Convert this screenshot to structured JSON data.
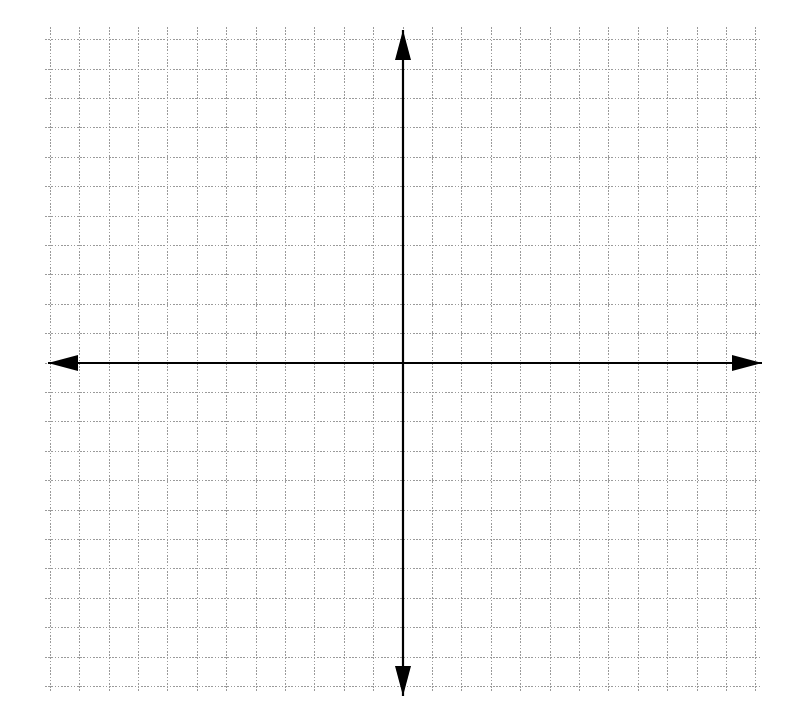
{
  "figure": {
    "title": "",
    "width": 795,
    "height": 719,
    "background_color": "#ffffff"
  },
  "chart_data": {
    "type": "scatter",
    "title": "",
    "subtitle": "",
    "xlabel": "",
    "ylabel": "",
    "series": [],
    "x": [],
    "values": [],
    "annotations": [],
    "legend": {
      "entries": [],
      "position": "none",
      "visible": false
    },
    "grid": {
      "visible": true,
      "style": "dotted",
      "color": "#9a9a9a",
      "line_width": 1,
      "cell_size_px": 29.4,
      "columns": 24,
      "rows": 22,
      "columns_left_of_origin": 12,
      "columns_right_of_origin": 12,
      "rows_above_origin": 11,
      "rows_below_origin": 11,
      "left_px": 45,
      "top_px": 27,
      "right_px": 760,
      "bottom_px": 692
    },
    "axes": {
      "color": "#000000",
      "line_width": 2.2,
      "origin_px": [
        403,
        363
      ],
      "x_axis_y_px": 363,
      "y_axis_x_px": 403,
      "x_axis_start_px": 48,
      "x_axis_end_px": 762,
      "y_axis_start_px": 30,
      "y_axis_end_px": 696,
      "arrowheads": [
        "left",
        "right",
        "up",
        "down"
      ],
      "tick_labels_visible": false,
      "xticks": [],
      "yticks": [],
      "xlim": [
        -12,
        12
      ],
      "ylim": [
        -11,
        11
      ]
    }
  },
  "labels": {
    "x_axis_name": "x-axis",
    "y_axis_name": "y-axis",
    "origin_name": "origin"
  }
}
